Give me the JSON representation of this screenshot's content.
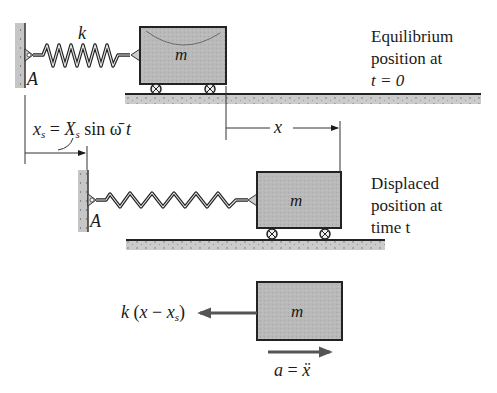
{
  "colors": {
    "ink": "#1a1a1a",
    "mass_fill": "#b8b8b8",
    "ground_fill": "#c9c9c9",
    "wall_fill": "#c4c4c4",
    "arrow": "#555555"
  },
  "panel_equilibrium": {
    "spring_label": "k",
    "anchor_label": "A",
    "mass_label": "m",
    "caption": [
      "Equilibrium",
      "position at",
      "t = 0"
    ]
  },
  "dimensions": {
    "support_displacement": {
      "lhs": "x",
      "lhs_sub": "s",
      "eq": " = ",
      "rhs": "X",
      "rhs_sub": "s",
      "rest": " sin ",
      "omega": "ω̄",
      "t": "t"
    },
    "mass_displacement_label": "x"
  },
  "panel_displaced": {
    "anchor_label": "A",
    "mass_label": "m",
    "caption": [
      "Displaced",
      "position at",
      "time t"
    ]
  },
  "panel_free_body": {
    "mass_label": "m",
    "force_label": {
      "k": "k",
      "open": " (",
      "x": "x",
      "minus": " − ",
      "xs": "x",
      "xs_sub": "s",
      "close": ")"
    },
    "acceleration_label": {
      "a": "a",
      "eq": " = ",
      "xddot": "ẍ"
    }
  }
}
